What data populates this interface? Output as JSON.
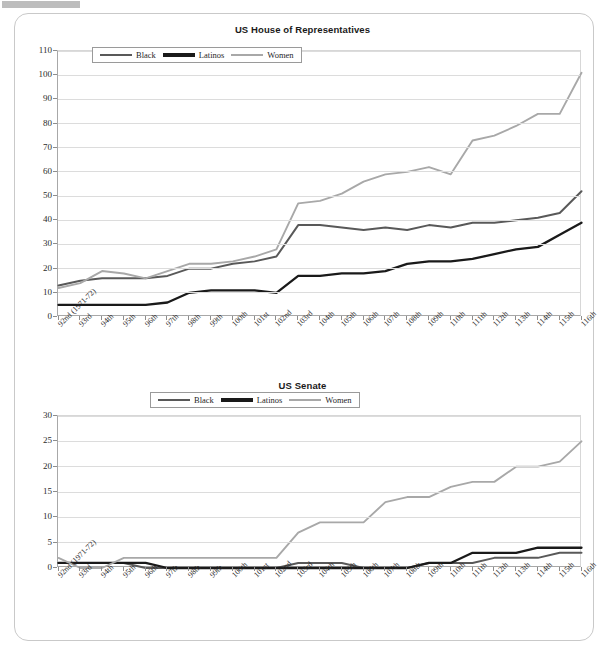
{
  "page": {
    "top_strip_fragments": [
      "",
      "",
      "",
      ""
    ]
  },
  "charts": [
    {
      "id": "house",
      "title": "US House of Representatives",
      "legend": [
        {
          "label": "Black",
          "color": "#595959",
          "width": 2.4
        },
        {
          "label": "Latinos",
          "color": "#1a1a1a",
          "width": 3.2
        },
        {
          "label": "Women",
          "color": "#a8a8a8",
          "width": 2.2
        }
      ],
      "chart_data": {
        "type": "line",
        "title": "US House of Representatives",
        "xlabel": "",
        "ylabel": "",
        "ylim": [
          0,
          110
        ],
        "ytick_step": 10,
        "grid": true,
        "legend_position": "top-center-inside",
        "yticks": [
          0,
          10,
          20,
          30,
          40,
          50,
          60,
          70,
          80,
          90,
          100,
          110
        ],
        "categories": [
          "92nd (1971-72)",
          "93rd",
          "94th",
          "95th",
          "96th",
          "97th",
          "98th",
          "99th",
          "100th",
          "101st",
          "102nd",
          "103rd",
          "104th",
          "105th",
          "106th",
          "107th",
          "108th",
          "109th",
          "110th",
          "111th",
          "112th",
          "113th",
          "114th",
          "115th",
          "116th"
        ],
        "series": [
          {
            "name": "Black",
            "color": "#595959",
            "values": [
              13,
              15,
              16,
              16,
              16,
              17,
              20,
              20,
              22,
              23,
              25,
              38,
              38,
              37,
              36,
              37,
              36,
              38,
              37,
              39,
              39,
              40,
              41,
              43,
              52
            ]
          },
          {
            "name": "Latinos",
            "color": "#1a1a1a",
            "values": [
              5,
              5,
              5,
              5,
              5,
              6,
              10,
              11,
              11,
              11,
              10,
              17,
              17,
              18,
              18,
              19,
              22,
              23,
              23,
              24,
              26,
              28,
              29,
              34,
              39
            ]
          },
          {
            "name": "Women",
            "color": "#a8a8a8",
            "values": [
              12,
              14,
              19,
              18,
              16,
              19,
              22,
              22,
              23,
              25,
              28,
              47,
              48,
              51,
              56,
              59,
              60,
              62,
              59,
              73,
              75,
              79,
              84,
              84,
              101
            ]
          }
        ]
      }
    },
    {
      "id": "senate",
      "title": "US Senate",
      "legend": [
        {
          "label": "Black",
          "color": "#595959",
          "width": 2.4
        },
        {
          "label": "Latinos",
          "color": "#1a1a1a",
          "width": 3.2
        },
        {
          "label": "Women",
          "color": "#a8a8a8",
          "width": 2.2
        }
      ],
      "chart_data": {
        "type": "line",
        "title": "US Senate",
        "xlabel": "",
        "ylabel": "",
        "ylim": [
          0,
          30
        ],
        "ytick_step": 5,
        "grid": true,
        "legend_position": "above-plot-center",
        "yticks": [
          0,
          5,
          10,
          15,
          20,
          25,
          30
        ],
        "categories": [
          "92nd (1971-72)",
          "93rd",
          "94th",
          "95th",
          "96th",
          "97th",
          "98th",
          "99th",
          "100th",
          "101st",
          "102nd",
          "103rd",
          "104th",
          "105th",
          "106th",
          "107th",
          "108th",
          "109th",
          "110th",
          "111th",
          "112th",
          "113th",
          "114th",
          "115th",
          "116th"
        ],
        "series": [
          {
            "name": "Black",
            "color": "#595959",
            "values": [
              1,
              1,
              1,
              1,
              0,
              0,
              0,
              0,
              0,
              0,
              0,
              1,
              1,
              1,
              0,
              0,
              0,
              1,
              1,
              1,
              2,
              2,
              2,
              3,
              3
            ]
          },
          {
            "name": "Latinos",
            "color": "#1a1a1a",
            "values": [
              1,
              1,
              1,
              1,
              1,
              0,
              0,
              0,
              0,
              0,
              0,
              0,
              0,
              0,
              0,
              0,
              0,
              1,
              1,
              3,
              3,
              3,
              4,
              4,
              4
            ]
          },
          {
            "name": "Women",
            "color": "#a8a8a8",
            "values": [
              2,
              0,
              0,
              2,
              2,
              2,
              2,
              2,
              2,
              2,
              2,
              7,
              9,
              9,
              9,
              13,
              14,
              14,
              16,
              17,
              17,
              20,
              20,
              21,
              25
            ]
          }
        ]
      }
    }
  ]
}
